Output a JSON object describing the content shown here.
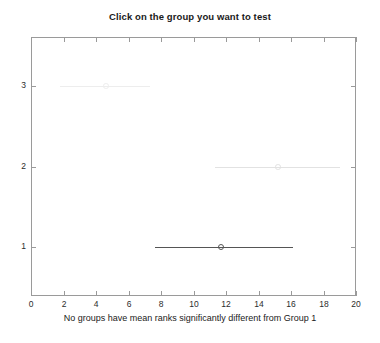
{
  "chart_data": {
    "type": "line",
    "title": "Click on the group you want to test",
    "subtitle": "",
    "xlabel": "No groups have mean ranks significantly different from Group 1",
    "ylabel": "",
    "xlim": [
      0,
      20
    ],
    "ylim": [
      3.6,
      0.4
    ],
    "grid": false,
    "legend": null,
    "xticks": [
      0,
      2,
      4,
      6,
      8,
      10,
      12,
      14,
      16,
      18,
      20
    ],
    "xticklabels": [
      "0",
      "2",
      "4",
      "6",
      "8",
      "10",
      "12",
      "14",
      "16",
      "18",
      "20"
    ],
    "yticks": [
      1,
      2,
      3
    ],
    "yticklabels": [
      "1",
      "2",
      "3"
    ],
    "series": [
      {
        "name": "Group 1",
        "group": 1,
        "mean_rank": 11.7,
        "ci_low": 7.6,
        "ci_high": 16.1,
        "selected": true,
        "color": "#555555"
      },
      {
        "name": "Group 2",
        "group": 2,
        "mean_rank": 15.2,
        "ci_low": 11.3,
        "ci_high": 19.0,
        "selected": false,
        "color": "#e2e2e2"
      },
      {
        "name": "Group 3",
        "group": 3,
        "mean_rank": 4.6,
        "ci_low": 1.8,
        "ci_high": 7.3,
        "selected": false,
        "color": "#ededed"
      }
    ],
    "marker": "open-circle",
    "annotations": []
  },
  "figure": {
    "background_color": "#ffffff",
    "axes_color": "#9a9a9a",
    "text_color": "#1a1a1a"
  }
}
